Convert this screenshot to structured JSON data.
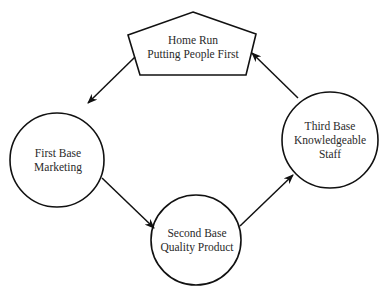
{
  "diagram": {
    "type": "cycle",
    "nodes": [
      {
        "id": "home",
        "shape": "pentagon",
        "lines": [
          "Home Run",
          "Putting People First"
        ]
      },
      {
        "id": "first",
        "shape": "circle",
        "lines": [
          "First Base",
          "Marketing"
        ]
      },
      {
        "id": "second",
        "shape": "circle",
        "lines": [
          "Second Base",
          "Quality Product"
        ]
      },
      {
        "id": "third",
        "shape": "circle",
        "lines": [
          "Third Base",
          "Knowledgeable",
          "Staff"
        ]
      }
    ],
    "edges": [
      {
        "from": "home",
        "to": "first"
      },
      {
        "from": "first",
        "to": "second"
      },
      {
        "from": "second",
        "to": "third"
      },
      {
        "from": "third",
        "to": "home"
      }
    ],
    "stroke_color": "#111111"
  }
}
